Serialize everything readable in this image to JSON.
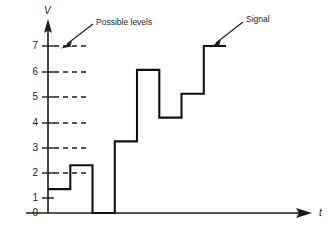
{
  "figure": {
    "axes": {
      "y_label": "V",
      "x_label": "t",
      "y_ticks": [
        "0",
        "1",
        "2",
        "3",
        "4",
        "5",
        "6",
        "7"
      ],
      "y_tick_values": [
        0,
        1,
        2,
        3,
        4,
        5,
        6,
        7
      ],
      "y_min": 0,
      "y_max": 7,
      "x_min": 0,
      "x_max": 10
    },
    "annotations": [
      {
        "name": "possible-levels",
        "label": "Possible levels"
      },
      {
        "name": "signal",
        "label": "Signal"
      }
    ],
    "colors": {
      "ink": "#1a1a1a",
      "signal": "#111111",
      "background": "#ffffff"
    }
  },
  "chart_data": {
    "type": "line",
    "xlabel": "t",
    "ylabel": "V",
    "ylim": [
      0,
      7
    ],
    "xlim": [
      0,
      10
    ],
    "grid": false,
    "legend": "none",
    "step_interpolation": "post",
    "yticks": [
      0,
      1,
      2,
      3,
      4,
      5,
      6,
      7
    ],
    "ytick_labels": [
      "0",
      "1",
      "2",
      "3",
      "4",
      "5",
      "6",
      "7"
    ],
    "dashed_level_guides": [
      2,
      3,
      4,
      5,
      6,
      7
    ],
    "series": [
      {
        "name": "Signal",
        "x": [
          0,
          1,
          2,
          3,
          4,
          5,
          6,
          7,
          8
        ],
        "values": [
          1,
          2,
          0,
          3,
          6,
          4,
          5,
          7,
          7
        ]
      }
    ],
    "annotations": [
      {
        "text": "Possible levels",
        "points_to": [
          0.45,
          7
        ]
      },
      {
        "text": "Signal",
        "points_to": [
          7.3,
          7
        ]
      }
    ]
  }
}
